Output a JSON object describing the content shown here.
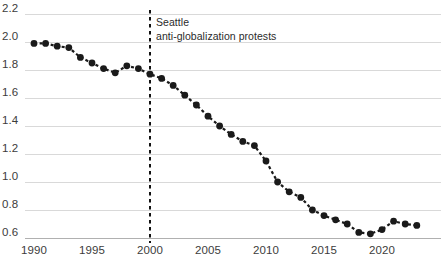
{
  "chart_data": {
    "type": "line",
    "title": "",
    "subtitle": "",
    "xlabel": "",
    "ylabel": "",
    "xlim": [
      1989.2,
      2023.6
    ],
    "ylim": [
      0.54,
      2.26
    ],
    "grid": true,
    "legend_position": "none",
    "marker": "circle",
    "line_style": "dashed",
    "series_color": "#1a1a1a",
    "grid_color": "#d9d9d9",
    "axis_color": "#b0b0b0",
    "x": [
      1990,
      1991,
      1992,
      1993,
      1994,
      1995,
      1996,
      1997,
      1998,
      1999,
      2000,
      2001,
      2002,
      2003,
      2004,
      2005,
      2006,
      2007,
      2008,
      2009,
      2010,
      2011,
      2012,
      2013,
      2014,
      2015,
      2016,
      2017,
      2018,
      2019,
      2020,
      2021,
      2022,
      2023
    ],
    "values": [
      1.99,
      1.99,
      1.97,
      1.96,
      1.89,
      1.85,
      1.81,
      1.78,
      1.83,
      1.81,
      1.77,
      1.74,
      1.69,
      1.62,
      1.55,
      1.47,
      1.4,
      1.34,
      1.29,
      1.26,
      1.15,
      1.0,
      0.93,
      0.89,
      0.8,
      0.76,
      0.73,
      0.7,
      0.64,
      0.63,
      0.66,
      0.72,
      0.7,
      0.69
    ],
    "yticks": [
      0.6,
      0.8,
      1.0,
      1.2,
      1.4,
      1.6,
      1.8,
      2.0,
      2.2
    ],
    "ytick_labels": [
      "0.6",
      "0.8",
      "1.0",
      "1.2",
      "1.4",
      "1.6",
      "1.8",
      "2.0",
      "2.2"
    ],
    "xticks": [
      1990,
      1995,
      2000,
      2005,
      2010,
      2015,
      2020
    ],
    "xtick_labels": [
      "1990",
      "1995",
      "2000",
      "2005",
      "2010",
      "2015",
      "2020"
    ],
    "annotations": [
      {
        "type": "vline",
        "x": 2000,
        "style": "dashed",
        "color": "#111111",
        "label_line_1": "Seattle",
        "label_line_2": "anti-globalization protests"
      }
    ]
  }
}
